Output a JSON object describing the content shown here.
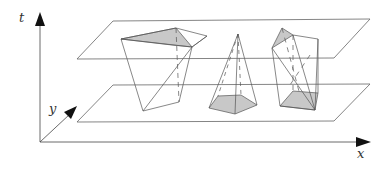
{
  "diagram": {
    "axes": {
      "t_label": "t",
      "y_label": "y",
      "x_label": "x"
    },
    "planes": [
      {
        "name": "upper-plane",
        "points": [
          [
            113,
            21
          ],
          [
            370,
            19
          ],
          [
            334,
            58
          ],
          [
            77,
            59
          ]
        ]
      },
      {
        "name": "lower-plane",
        "points": [
          [
            113,
            85
          ],
          [
            370,
            84
          ],
          [
            334,
            121
          ],
          [
            77,
            122
          ]
        ]
      }
    ],
    "shapes": [
      {
        "name": "frustum",
        "description": "inverted quadrilateral frustum with shaded top face"
      },
      {
        "name": "pentagonal-pyramid",
        "description": "pyramid with shaded pentagonal base"
      },
      {
        "name": "twisted-prism",
        "description": "polyhedron with shaded top triangle and shaded bottom face"
      }
    ],
    "colors": {
      "line": "#555555",
      "shade": "#c8c8c8",
      "axis": "#444444",
      "arrow": "#111111"
    }
  }
}
